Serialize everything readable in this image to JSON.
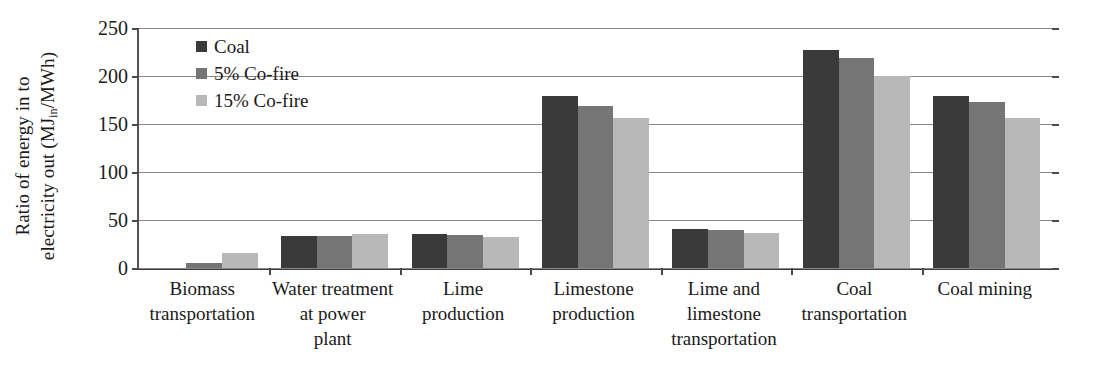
{
  "chart_data": {
    "type": "bar",
    "title": "",
    "xlabel": "",
    "ylabel": "Ratio of energy in to electricity out (MJin/MWh)",
    "ylim": [
      0,
      250
    ],
    "yticks": [
      0,
      50,
      100,
      150,
      200,
      250
    ],
    "grid": true,
    "legend_position": "top-left-inside",
    "categories": [
      "Biomass transportation",
      "Water treatment at power plant",
      "Lime production",
      "Limestone production",
      "Lime and limestone transportation",
      "Coal transportation",
      "Coal mining"
    ],
    "series": [
      {
        "name": "Coal",
        "color": "#3a3a3a",
        "values": [
          0,
          33,
          35,
          179,
          41,
          227,
          179
        ]
      },
      {
        "name": "5% Co-fire",
        "color": "#757575",
        "values": [
          5,
          33,
          34,
          169,
          40,
          219,
          173
        ]
      },
      {
        "name": "15% Co-fire",
        "color": "#b8b8b8",
        "values": [
          16,
          35,
          32,
          156,
          36,
          200,
          156
        ]
      }
    ]
  },
  "axis": {
    "y_title_line1": "Ratio of energy in to",
    "y_title_line2_pre": "electricity out (MJ",
    "y_title_sub": "in",
    "y_title_line2_post": "/MWh)",
    "tick_labels": [
      "0",
      "50",
      "100",
      "150",
      "200",
      "250"
    ]
  },
  "legend": {
    "items": [
      {
        "label": "Coal"
      },
      {
        "label": "5% Co-fire"
      },
      {
        "label": "15% Co-fire"
      }
    ]
  },
  "category_labels": [
    {
      "lines": [
        "Biomass",
        "transportation"
      ]
    },
    {
      "lines": [
        "Water treatment",
        "at power",
        "plant"
      ]
    },
    {
      "lines": [
        "Lime",
        "production"
      ]
    },
    {
      "lines": [
        "Limestone",
        "production"
      ]
    },
    {
      "lines": [
        "Lime and",
        "limestone",
        "transportation"
      ]
    },
    {
      "lines": [
        "Coal",
        "transportation"
      ]
    },
    {
      "lines": [
        "Coal mining"
      ]
    }
  ]
}
